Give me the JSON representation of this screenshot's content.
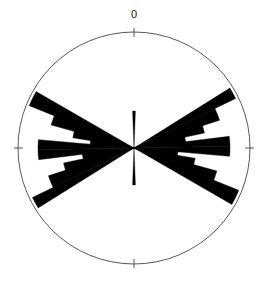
{
  "chart_data": {
    "type": "rose",
    "title": "",
    "subtitle": "",
    "xlabel": "",
    "ylabel": "",
    "grid": false,
    "legend": null,
    "orientation": "north-up-clockwise",
    "bidirectional": true,
    "center": {
      "x": 134,
      "y": 148
    },
    "outer_radius": 116,
    "axis_ticks": [
      {
        "angle_deg": 0,
        "label": "0",
        "show_label": true,
        "tick_length": 9
      },
      {
        "angle_deg": 90,
        "label": "",
        "show_label": false,
        "tick_length": 9
      },
      {
        "angle_deg": 180,
        "label": "",
        "show_label": false,
        "tick_length": 9
      },
      {
        "angle_deg": 270,
        "label": "",
        "show_label": false,
        "tick_length": 9
      }
    ],
    "axis_range_deg": [
      0,
      360
    ],
    "radial_range": [
      0,
      116
    ],
    "bin_width_deg": 10,
    "colors": {
      "petal_fill": "#000000",
      "circle_stroke": "#444444",
      "tick_stroke": "#444444",
      "background": "#ffffff",
      "label_text": "#1a1a1a"
    },
    "petals": [
      {
        "center_deg": 0,
        "half_width_deg": 2.2,
        "radius": 37
      },
      {
        "center_deg": 180,
        "half_width_deg": 2.2,
        "radius": 37
      },
      {
        "center_deg": 61,
        "half_width_deg": 3.0,
        "radius": 113
      },
      {
        "center_deg": 241,
        "half_width_deg": 3.0,
        "radius": 113
      },
      {
        "center_deg": 68,
        "half_width_deg": 4.0,
        "radius": 90
      },
      {
        "center_deg": 248,
        "half_width_deg": 4.0,
        "radius": 90
      },
      {
        "center_deg": 74,
        "half_width_deg": 4.0,
        "radius": 72
      },
      {
        "center_deg": 254,
        "half_width_deg": 4.0,
        "radius": 72
      },
      {
        "center_deg": 80,
        "half_width_deg": 4.0,
        "radius": 52
      },
      {
        "center_deg": 260,
        "half_width_deg": 4.0,
        "radius": 52
      },
      {
        "center_deg": 86,
        "half_width_deg": 3.0,
        "radius": 96
      },
      {
        "center_deg": 266,
        "half_width_deg": 3.0,
        "radius": 96
      },
      {
        "center_deg": 92,
        "half_width_deg": 3.0,
        "radius": 96
      },
      {
        "center_deg": 272,
        "half_width_deg": 3.0,
        "radius": 96
      },
      {
        "center_deg": 98,
        "half_width_deg": 4.0,
        "radius": 44
      },
      {
        "center_deg": 278,
        "half_width_deg": 4.0,
        "radius": 44
      },
      {
        "center_deg": 104,
        "half_width_deg": 4.5,
        "radius": 62
      },
      {
        "center_deg": 284,
        "half_width_deg": 4.5,
        "radius": 62
      },
      {
        "center_deg": 110,
        "half_width_deg": 4.5,
        "radius": 86
      },
      {
        "center_deg": 290,
        "half_width_deg": 4.5,
        "radius": 86
      },
      {
        "center_deg": 116,
        "half_width_deg": 4.0,
        "radius": 113
      },
      {
        "center_deg": 296,
        "half_width_deg": 4.0,
        "radius": 113
      }
    ]
  }
}
